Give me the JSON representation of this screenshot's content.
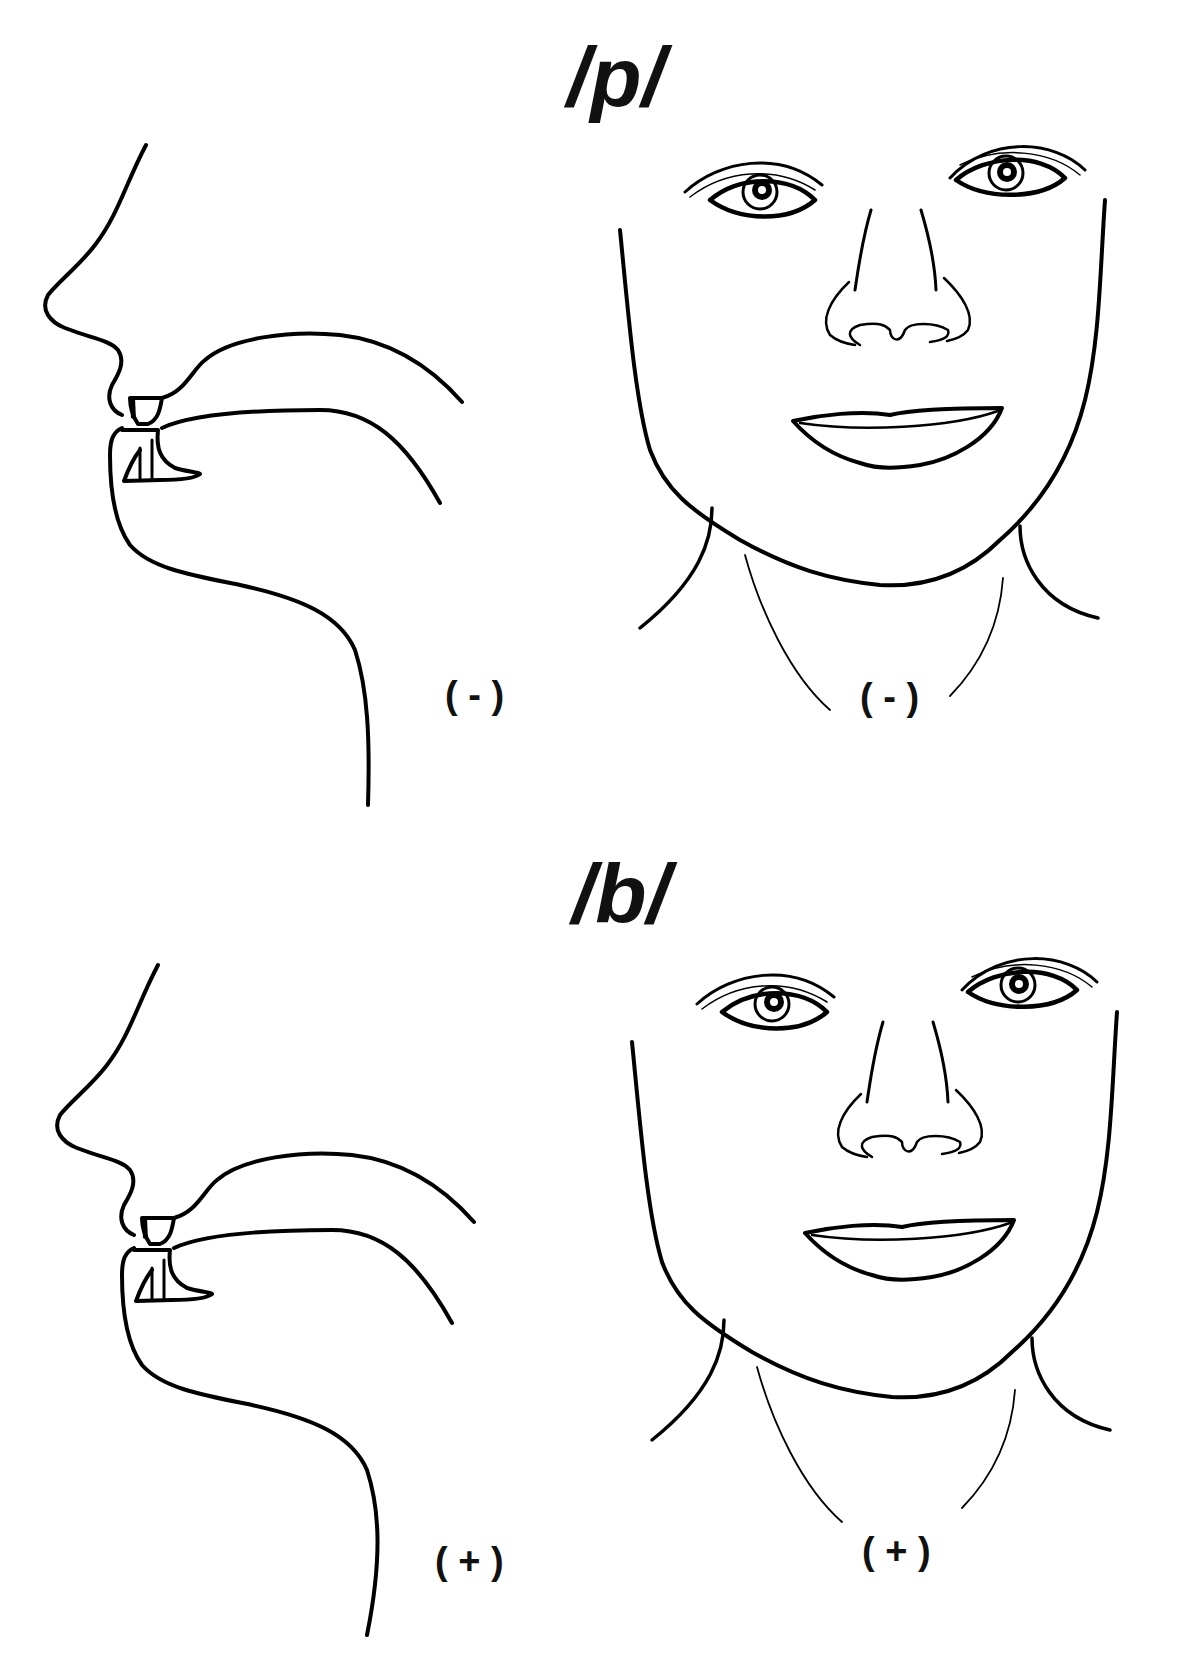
{
  "panels": [
    {
      "phoneme": "/p/",
      "description": "voiceless bilabial plosive",
      "profile_label": "( - )",
      "front_label": "( - )"
    },
    {
      "phoneme": "/b/",
      "description": "voiced bilabial plosive",
      "profile_label": "( + )",
      "front_label": "( + )"
    }
  ],
  "colors": {
    "line": "#000000",
    "background": "#ffffff"
  }
}
